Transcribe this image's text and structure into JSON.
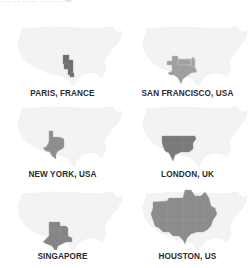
{
  "header": {
    "cut_text": "... ... ......  ...... ...M"
  },
  "colors": {
    "background": "#ffffff",
    "us_outline": "#f2f2f2",
    "us_outline_stroke": "#e8e8e8",
    "highlight": "#8c8c8c",
    "highlight_dark": "#6e6e6e",
    "label": "#2b2b2b"
  },
  "cards": [
    {
      "label": "PARIS, FRANCE",
      "highlight_region": "narrow-central-column"
    },
    {
      "label": "SAN FRANCISCO, USA",
      "highlight_region": "texas-oklahoma"
    },
    {
      "label": "NEW YORK, USA",
      "highlight_region": "texas"
    },
    {
      "label": "LONDON, UK",
      "highlight_region": "south-central-band"
    },
    {
      "label": "SINGAPORE",
      "highlight_region": "texas-oklahoma-arkansas"
    },
    {
      "label": "HOUSTON, US",
      "highlight_region": "central-eastern-us"
    }
  ]
}
